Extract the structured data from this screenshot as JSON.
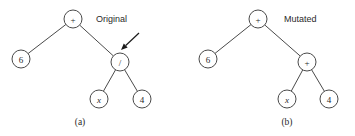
{
  "figure": {
    "title": "",
    "background": "#ffffff",
    "stroke_color": "#4a4a4a",
    "text_color": "#2a2a2a",
    "arrow_color": "#1a1a1a",
    "width": 355,
    "height": 136
  },
  "panels": [
    {
      "id": "a",
      "caption": "(a)",
      "caption_x": 80,
      "caption_y": 122,
      "annotation": "Original",
      "annotation_x": 96,
      "annotation_y": 19,
      "nodes": [
        {
          "id": "root",
          "label": "+",
          "italic": false,
          "cx": 73,
          "cy": 19,
          "r": 9
        },
        {
          "id": "left",
          "label": "6",
          "italic": false,
          "cx": 21,
          "cy": 59,
          "r": 9
        },
        {
          "id": "right",
          "label": "/",
          "italic": false,
          "cx": 120,
          "cy": 62,
          "r": 9
        },
        {
          "id": "rl",
          "label": "x",
          "italic": true,
          "cx": 99,
          "cy": 99,
          "r": 9
        },
        {
          "id": "rr",
          "label": "4",
          "italic": false,
          "cx": 142,
          "cy": 99,
          "r": 9
        }
      ],
      "edges": [
        {
          "from": "root",
          "to": "left"
        },
        {
          "from": "root",
          "to": "right"
        },
        {
          "from": "right",
          "to": "rl"
        },
        {
          "from": "right",
          "to": "rr"
        }
      ],
      "arrow": {
        "present": true,
        "x1": 139,
        "y1": 33,
        "x2": 121,
        "y2": 50,
        "target_node": "right"
      }
    },
    {
      "id": "b",
      "caption": "(b)",
      "caption_x": 287,
      "caption_y": 122,
      "annotation": "Mutated",
      "annotation_x": 284,
      "annotation_y": 19,
      "nodes": [
        {
          "id": "root",
          "label": "+",
          "italic": false,
          "cx": 258,
          "cy": 19,
          "r": 9
        },
        {
          "id": "left",
          "label": "6",
          "italic": false,
          "cx": 208,
          "cy": 59,
          "r": 9
        },
        {
          "id": "right",
          "label": "+",
          "italic": false,
          "cx": 307,
          "cy": 62,
          "r": 9
        },
        {
          "id": "rl",
          "label": "x",
          "italic": true,
          "cx": 287,
          "cy": 99,
          "r": 9
        },
        {
          "id": "rr",
          "label": "4",
          "italic": false,
          "cx": 329,
          "cy": 99,
          "r": 9
        }
      ],
      "edges": [
        {
          "from": "root",
          "to": "left"
        },
        {
          "from": "root",
          "to": "right"
        },
        {
          "from": "right",
          "to": "rl"
        },
        {
          "from": "right",
          "to": "rr"
        }
      ],
      "arrow": {
        "present": false
      }
    }
  ]
}
